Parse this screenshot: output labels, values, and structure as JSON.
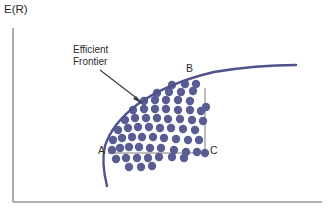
{
  "figure": {
    "width": 328,
    "height": 210,
    "background": "#ffffff"
  },
  "axes": {
    "y_label": "E(R)",
    "x_label": "",
    "axis_color": "#6b6b6b",
    "y_axis": {
      "x": 13,
      "y_top": 28,
      "y_bottom": 202
    },
    "x_axis": {
      "y": 202,
      "x_left": 13,
      "x_right": 322
    }
  },
  "annotation": {
    "text": "Efficient\nFrontier",
    "line1": "Efficient",
    "line2": "Frontier",
    "arrow_from": [
      100,
      70
    ],
    "arrow_to": [
      142,
      103
    ],
    "arrow_color": "#3a3a3a"
  },
  "points": {
    "A": {
      "label": "A",
      "x": 106,
      "y": 153
    },
    "B": {
      "label": "B",
      "x": 196,
      "y": 78
    },
    "C": {
      "label": "C",
      "x": 205,
      "y": 153
    }
  },
  "colors": {
    "scatter": "#5a5d93",
    "frontier": "#4f538c",
    "connector": "#6e6e6e",
    "text": "#2b2b2b",
    "axis": "#6b6b6b"
  },
  "chart_data": {
    "type": "scatter",
    "title": "",
    "xlabel": "",
    "ylabel": "E(R)",
    "grid": false,
    "legend": null,
    "xlim": [
      13,
      322
    ],
    "ylim": [
      202,
      28
    ],
    "annotations": [
      {
        "text": "Efficient Frontier",
        "x": 73,
        "y": 50,
        "arrow_to": [
          142,
          103
        ]
      },
      {
        "text": "A",
        "x": 106,
        "y": 153
      },
      {
        "text": "B",
        "x": 196,
        "y": 78
      },
      {
        "text": "C",
        "x": 205,
        "y": 153
      }
    ],
    "frontier_curve": {
      "name": "Efficient Frontier",
      "color": "#4f538c",
      "width": 2.4,
      "path_points": [
        [
          107,
          186
        ],
        [
          104,
          172
        ],
        [
          103,
          160
        ],
        [
          104,
          150
        ],
        [
          108,
          138
        ],
        [
          115,
          126
        ],
        [
          124,
          115
        ],
        [
          136,
          105
        ],
        [
          150,
          95
        ],
        [
          166,
          87
        ],
        [
          182,
          80
        ],
        [
          200,
          75
        ],
        [
          222,
          71
        ],
        [
          248,
          68
        ],
        [
          272,
          66
        ],
        [
          296,
          65
        ]
      ]
    },
    "connectors": [
      {
        "name": "A-to-C-horizontal",
        "from": [
          108,
          153
        ],
        "to": [
          205,
          153
        ]
      },
      {
        "name": "B-to-C-vertical",
        "from": [
          205,
          153
        ],
        "to": [
          205,
          88
        ]
      }
    ],
    "scatter_points": [
      [
        112,
        150
      ],
      [
        120,
        148
      ],
      [
        129,
        147
      ],
      [
        139,
        147
      ],
      [
        150,
        148
      ],
      [
        161,
        148
      ],
      [
        174,
        150
      ],
      [
        186,
        152
      ],
      [
        197,
        152
      ],
      [
        205,
        153
      ],
      [
        116,
        159
      ],
      [
        126,
        158
      ],
      [
        137,
        158
      ],
      [
        148,
        158
      ],
      [
        159,
        157
      ],
      [
        172,
        157
      ],
      [
        184,
        158
      ],
      [
        129,
        167
      ],
      [
        141,
        167
      ],
      [
        152,
        166
      ],
      [
        113,
        140
      ],
      [
        122,
        138
      ],
      [
        132,
        137
      ],
      [
        142,
        137
      ],
      [
        153,
        137
      ],
      [
        164,
        138
      ],
      [
        176,
        139
      ],
      [
        188,
        140
      ],
      [
        199,
        140
      ],
      [
        118,
        130
      ],
      [
        128,
        128
      ],
      [
        138,
        127
      ],
      [
        149,
        127
      ],
      [
        160,
        128
      ],
      [
        171,
        128
      ],
      [
        183,
        129
      ],
      [
        195,
        130
      ],
      [
        125,
        120
      ],
      [
        135,
        118
      ],
      [
        146,
        118
      ],
      [
        157,
        118
      ],
      [
        168,
        119
      ],
      [
        180,
        119
      ],
      [
        192,
        120
      ],
      [
        203,
        121
      ],
      [
        133,
        110
      ],
      [
        144,
        109
      ],
      [
        155,
        109
      ],
      [
        166,
        109
      ],
      [
        178,
        110
      ],
      [
        190,
        110
      ],
      [
        201,
        111
      ],
      [
        144,
        101
      ],
      [
        155,
        100
      ],
      [
        166,
        100
      ],
      [
        178,
        100
      ],
      [
        190,
        101
      ],
      [
        206,
        107
      ],
      [
        157,
        93
      ],
      [
        169,
        92
      ],
      [
        181,
        92
      ],
      [
        193,
        91
      ],
      [
        172,
        85
      ],
      [
        185,
        84
      ],
      [
        196,
        84
      ]
    ],
    "scatter_radius": 4.2,
    "scatter_color": "#5a5d93",
    "point_count": 67
  }
}
